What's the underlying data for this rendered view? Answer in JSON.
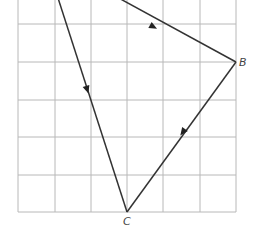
{
  "diagram": {
    "type": "vector-triangle-on-grid",
    "grid": {
      "x_lines": [
        18,
        55,
        91,
        127,
        163,
        200,
        236
      ],
      "y_lines": [
        24,
        62,
        100,
        137,
        175,
        212
      ],
      "x_min": 18,
      "x_max": 236,
      "y_min": 0,
      "y_max": 212,
      "color": "#b8b8b8"
    },
    "vertices": {
      "A": {
        "x": 71,
        "y": -28,
        "label": ""
      },
      "B": {
        "x": 236,
        "y": 62,
        "label": "B"
      },
      "C": {
        "x": 127,
        "y": 212,
        "label": "C"
      }
    },
    "edges": [
      {
        "from": "A",
        "to": "B",
        "arrow": "toward B"
      },
      {
        "from": "B",
        "to": "C",
        "arrow": "toward C"
      },
      {
        "from": "A",
        "to": "C",
        "arrow": "toward C"
      }
    ],
    "labels": {
      "B": "B",
      "C": "C"
    },
    "colors": {
      "edge": "#333333",
      "grid": "#b8b8b8",
      "label": "#444444"
    }
  }
}
